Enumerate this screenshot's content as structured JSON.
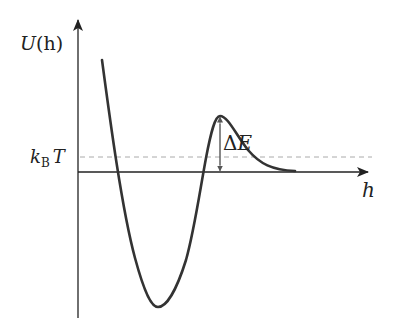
{
  "diagram": {
    "y_axis": {
      "label_main": "U",
      "label_arg": "(h)"
    },
    "x_axis": {
      "label": "h"
    },
    "threshold": {
      "label_k": "k",
      "label_sub": "B",
      "label_T": "T",
      "style": "dashed"
    },
    "barrier": {
      "label_delta": "Δ",
      "label_E": "E"
    },
    "colors": {
      "axis": "#222222",
      "curve": "#333333",
      "dashed": "#aaaaaa",
      "arrow": "#555555"
    }
  }
}
